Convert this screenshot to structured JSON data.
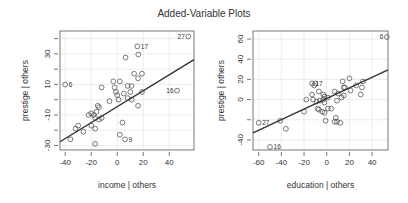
{
  "title": "Added-Variable Plots",
  "chart_data": [
    {
      "type": "scatter",
      "title": "",
      "xlabel": "income | others",
      "ylabel": "prestige | others",
      "xlim": [
        -44,
        59
      ],
      "ylim": [
        -33,
        45
      ],
      "xticks": [
        -40,
        -20,
        0,
        20,
        40
      ],
      "yticks": [
        -30,
        -10,
        10,
        30
      ],
      "yticks_minor": [
        -20,
        0,
        20,
        40
      ],
      "grid": true,
      "fit_line": {
        "x": [
          -44,
          59
        ],
        "y": [
          -27.6,
          26.3
        ]
      },
      "points": [
        {
          "x": 54.6,
          "y": 41.4,
          "label": "27"
        },
        {
          "x": 15.4,
          "y": 34.9,
          "label": "17"
        },
        {
          "x": 16.2,
          "y": 29.6
        },
        {
          "x": 6.4,
          "y": 27.6
        },
        {
          "x": -40.0,
          "y": 9.9,
          "label": "6"
        },
        {
          "x": 46.0,
          "y": 5.9,
          "label": "16"
        },
        {
          "x": 13.0,
          "y": 17.0
        },
        {
          "x": 19.0,
          "y": 17.0
        },
        {
          "x": 16.0,
          "y": 14.0
        },
        {
          "x": -3.0,
          "y": 12.0
        },
        {
          "x": 2.0,
          "y": 12.0
        },
        {
          "x": -12.0,
          "y": 8.0
        },
        {
          "x": -2.0,
          "y": 8.0
        },
        {
          "x": 8.0,
          "y": 9.0
        },
        {
          "x": 11.0,
          "y": 9.0
        },
        {
          "x": -1.0,
          "y": 5.0
        },
        {
          "x": 0.0,
          "y": 3.0
        },
        {
          "x": 5.0,
          "y": 4.0
        },
        {
          "x": 10.0,
          "y": 5.0
        },
        {
          "x": 19.0,
          "y": 5.0
        },
        {
          "x": -6.0,
          "y": -1.0
        },
        {
          "x": 1.0,
          "y": 0.0
        },
        {
          "x": 8.0,
          "y": 1.0
        },
        {
          "x": 11.0,
          "y": 0.0
        },
        {
          "x": 16.0,
          "y": -4.0
        },
        {
          "x": -15.0,
          "y": -4.0
        },
        {
          "x": -14.0,
          "y": -5.0
        },
        {
          "x": -16.0,
          "y": -8.0
        },
        {
          "x": -20.0,
          "y": -9.0
        },
        {
          "x": -18.0,
          "y": -10.0
        },
        {
          "x": -22.0,
          "y": -10.0
        },
        {
          "x": -14.0,
          "y": -13.0
        },
        {
          "x": -17.0,
          "y": -12.0
        },
        {
          "x": -12.0,
          "y": -12.0
        },
        {
          "x": 4.0,
          "y": -15.0
        },
        {
          "x": -30.0,
          "y": -17.0
        },
        {
          "x": -20.0,
          "y": -17.0
        },
        {
          "x": -32.0,
          "y": -19.0
        },
        {
          "x": -17.0,
          "y": -19.0
        },
        {
          "x": -26.0,
          "y": -21.0
        },
        {
          "x": 2.0,
          "y": -23.0
        },
        {
          "x": 6.0,
          "y": -26.0,
          "label": "9"
        },
        {
          "x": -36.0,
          "y": -26.0
        },
        {
          "x": -17.0,
          "y": -29.0
        }
      ]
    },
    {
      "type": "scatter",
      "title": "",
      "xlabel": "education | others",
      "ylabel": "prestige | others",
      "xlim": [
        -65,
        54
      ],
      "ylim": [
        -50,
        68
      ],
      "xticks": [
        -60,
        -40,
        -20,
        0,
        20,
        40
      ],
      "yticks": [
        -40,
        0,
        20,
        40,
        60
      ],
      "yticks_minor": [
        -20
      ],
      "grid": true,
      "fit_line": {
        "x": [
          -65,
          54
        ],
        "y": [
          -33,
          29.4
        ]
      },
      "points": [
        {
          "x": 53.0,
          "y": 62.0,
          "label": "6"
        },
        {
          "x": -13.0,
          "y": 16.0,
          "label": "17"
        },
        {
          "x": -10.0,
          "y": 16.0
        },
        {
          "x": -11.0,
          "y": 14.0
        },
        {
          "x": 20.0,
          "y": 21.0
        },
        {
          "x": 14.0,
          "y": 18.0
        },
        {
          "x": 32.0,
          "y": 18.0
        },
        {
          "x": 15.0,
          "y": 12.0
        },
        {
          "x": 16.0,
          "y": 12.0
        },
        {
          "x": 26.0,
          "y": 14.0
        },
        {
          "x": 21.0,
          "y": 9.0
        },
        {
          "x": 31.0,
          "y": 12.0
        },
        {
          "x": 7.0,
          "y": 8.0
        },
        {
          "x": -7.0,
          "y": 8.0
        },
        {
          "x": 30.0,
          "y": 5.0
        },
        {
          "x": -13.0,
          "y": 5.0
        },
        {
          "x": -3.0,
          "y": 5.0
        },
        {
          "x": 10.0,
          "y": 6.0
        },
        {
          "x": 15.0,
          "y": 4.0
        },
        {
          "x": -2.0,
          "y": 3.0
        },
        {
          "x": 1.0,
          "y": 2.0
        },
        {
          "x": 13.0,
          "y": 2.0
        },
        {
          "x": -18.0,
          "y": 0.0
        },
        {
          "x": -12.0,
          "y": 0.0
        },
        {
          "x": -3.0,
          "y": 0.0
        },
        {
          "x": -6.0,
          "y": -1.0
        },
        {
          "x": 9.0,
          "y": -1.0
        },
        {
          "x": -9.0,
          "y": -2.0
        },
        {
          "x": -2.0,
          "y": -3.0
        },
        {
          "x": -8.0,
          "y": -9.0
        },
        {
          "x": -7.0,
          "y": -10.0
        },
        {
          "x": 1.0,
          "y": -9.0
        },
        {
          "x": 4.0,
          "y": -9.0
        },
        {
          "x": -20.0,
          "y": -12.0
        },
        {
          "x": -2.0,
          "y": -13.0
        },
        {
          "x": -4.0,
          "y": -12.0
        },
        {
          "x": 8.0,
          "y": -18.0
        },
        {
          "x": -1.0,
          "y": -21.0
        },
        {
          "x": 7.0,
          "y": -22.0
        },
        {
          "x": 9.0,
          "y": -22.0
        },
        {
          "x": 12.0,
          "y": -23.0
        },
        {
          "x": -41.0,
          "y": -21.0
        },
        {
          "x": -36.0,
          "y": -29.0
        },
        {
          "x": -60.0,
          "y": -23.0,
          "label": "27"
        },
        {
          "x": -50.0,
          "y": -47.0,
          "label": "16"
        }
      ]
    }
  ]
}
